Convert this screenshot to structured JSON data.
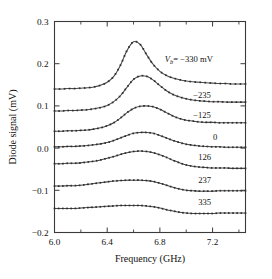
{
  "figure": {
    "background": "#ffffff",
    "curve_color": "#4a4a4a",
    "marker_color": "#2e2e2e",
    "axis_color": "#3a3a3a"
  },
  "chart_data": {
    "type": "line",
    "title": "",
    "xlabel": "Frequency (GHz)",
    "ylabel": "Diode signal (mV)",
    "xlim": [
      6.0,
      7.45
    ],
    "ylim": [
      -0.2,
      0.3
    ],
    "xticks": [
      6.0,
      6.4,
      6.8,
      7.2
    ],
    "xticklabels": [
      "6.0",
      "6.4",
      "6.8",
      "7.2"
    ],
    "xminorticks": [
      6.2,
      6.6,
      7.0,
      7.4
    ],
    "yticks": [
      0.3,
      0.2,
      0.1,
      0.0,
      -0.1,
      -0.2
    ],
    "yticklabels": [
      "0.3",
      "0.2",
      "0.1",
      "0.0",
      "-0.1",
      "-0.2"
    ],
    "grid": false,
    "legend": "inline-right-labels",
    "marker": "small-square",
    "annotation_prefix": "Vb =",
    "annotation_unit": "mV",
    "series": [
      {
        "name": "-330 mV",
        "label": "-330 mV",
        "label_full": "Vb = -330 mV",
        "label_x": 7.02,
        "label_y": 0.205,
        "baseline": 0.14,
        "amplitude": 0.112,
        "center": 6.605,
        "width": 0.165,
        "tail": 0.013,
        "x": [
          6.0,
          6.05,
          6.1,
          6.15,
          6.2,
          6.25,
          6.3,
          6.35,
          6.4,
          6.45,
          6.5,
          6.55,
          6.6,
          6.65,
          6.7,
          6.75,
          6.8,
          6.85,
          6.9,
          6.95,
          7.0,
          7.05,
          7.1,
          7.15,
          7.2,
          7.25,
          7.3,
          7.35,
          7.4,
          7.45
        ],
        "y": [
          0.14,
          0.14,
          0.141,
          0.141,
          0.142,
          0.143,
          0.145,
          0.149,
          0.156,
          0.17,
          0.196,
          0.231,
          0.252,
          0.246,
          0.221,
          0.198,
          0.182,
          0.172,
          0.166,
          0.162,
          0.159,
          0.157,
          0.156,
          0.155,
          0.154,
          0.153,
          0.153,
          0.152,
          0.152,
          0.152
        ]
      },
      {
        "name": "-235",
        "label": "-235",
        "label_x": 7.12,
        "label_y": 0.118,
        "baseline": 0.088,
        "amplitude": 0.082,
        "center": 6.755,
        "width": 0.185,
        "tail": 0.011,
        "x": [
          6.0,
          6.05,
          6.1,
          6.15,
          6.2,
          6.25,
          6.3,
          6.35,
          6.4,
          6.45,
          6.5,
          6.55,
          6.6,
          6.65,
          6.7,
          6.75,
          6.8,
          6.85,
          6.9,
          6.95,
          7.0,
          7.05,
          7.1,
          7.15,
          7.2,
          7.25,
          7.3,
          7.35,
          7.4,
          7.45
        ],
        "y": [
          0.088,
          0.088,
          0.089,
          0.089,
          0.09,
          0.091,
          0.093,
          0.096,
          0.101,
          0.11,
          0.124,
          0.144,
          0.163,
          0.171,
          0.17,
          0.161,
          0.148,
          0.136,
          0.127,
          0.121,
          0.117,
          0.114,
          0.112,
          0.111,
          0.11,
          0.11,
          0.109,
          0.109,
          0.109,
          0.109
        ]
      },
      {
        "name": "-125",
        "label": "-125",
        "label_x": 7.12,
        "label_y": 0.072,
        "baseline": 0.04,
        "amplitude": 0.055,
        "center": 6.8,
        "width": 0.195,
        "tail": 0.01,
        "x": [
          6.0,
          6.05,
          6.1,
          6.15,
          6.2,
          6.25,
          6.3,
          6.35,
          6.4,
          6.45,
          6.5,
          6.55,
          6.6,
          6.65,
          6.7,
          6.75,
          6.8,
          6.85,
          6.9,
          6.95,
          7.0,
          7.05,
          7.1,
          7.15,
          7.2,
          7.25,
          7.3,
          7.35,
          7.4,
          7.45
        ],
        "y": [
          0.04,
          0.04,
          0.041,
          0.041,
          0.042,
          0.043,
          0.045,
          0.048,
          0.053,
          0.06,
          0.071,
          0.084,
          0.094,
          0.099,
          0.1,
          0.098,
          0.092,
          0.084,
          0.076,
          0.07,
          0.066,
          0.064,
          0.062,
          0.061,
          0.061,
          0.06,
          0.06,
          0.06,
          0.06,
          0.06
        ]
      },
      {
        "name": "0",
        "label": "0",
        "label_x": 7.22,
        "label_y": 0.02,
        "baseline": 0.003,
        "amplitude": 0.034,
        "center": 6.745,
        "width": 0.215,
        "tail": 0.006,
        "x": [
          6.0,
          6.05,
          6.1,
          6.15,
          6.2,
          6.25,
          6.3,
          6.35,
          6.4,
          6.45,
          6.5,
          6.55,
          6.6,
          6.65,
          6.7,
          6.75,
          6.8,
          6.85,
          6.9,
          6.95,
          7.0,
          7.05,
          7.1,
          7.15,
          7.2,
          7.25,
          7.3,
          7.35,
          7.4,
          7.45
        ],
        "y": [
          0.003,
          0.003,
          0.004,
          0.004,
          0.005,
          0.006,
          0.008,
          0.01,
          0.013,
          0.018,
          0.024,
          0.03,
          0.035,
          0.037,
          0.037,
          0.035,
          0.03,
          0.024,
          0.018,
          0.013,
          0.009,
          0.007,
          0.005,
          0.004,
          0.003,
          0.003,
          0.002,
          0.002,
          0.002,
          0.002
        ]
      },
      {
        "name": "126",
        "label": "126",
        "label_x": 7.14,
        "label_y": -0.028,
        "baseline": -0.037,
        "amplitude": 0.03,
        "center": 6.71,
        "width": 0.235,
        "tail": 0.004,
        "x": [
          6.0,
          6.05,
          6.1,
          6.15,
          6.2,
          6.25,
          6.3,
          6.35,
          6.4,
          6.45,
          6.5,
          6.55,
          6.6,
          6.65,
          6.7,
          6.75,
          6.8,
          6.85,
          6.9,
          6.95,
          7.0,
          7.05,
          7.1,
          7.15,
          7.2,
          7.25,
          7.3,
          7.35,
          7.4,
          7.45
        ],
        "y": [
          -0.037,
          -0.037,
          -0.036,
          -0.036,
          -0.035,
          -0.033,
          -0.031,
          -0.028,
          -0.024,
          -0.02,
          -0.015,
          -0.011,
          -0.008,
          -0.007,
          -0.008,
          -0.011,
          -0.016,
          -0.022,
          -0.029,
          -0.035,
          -0.04,
          -0.043,
          -0.045,
          -0.046,
          -0.047,
          -0.047,
          -0.047,
          -0.048,
          -0.048,
          -0.048
        ]
      },
      {
        "name": "237",
        "label": "237",
        "label_x": 7.14,
        "label_y": -0.082,
        "baseline": -0.09,
        "amplitude": 0.017,
        "center": 6.66,
        "width": 0.29,
        "tail": 0.002,
        "x": [
          6.0,
          6.05,
          6.1,
          6.15,
          6.2,
          6.25,
          6.3,
          6.35,
          6.4,
          6.45,
          6.5,
          6.55,
          6.6,
          6.65,
          6.7,
          6.75,
          6.8,
          6.85,
          6.9,
          6.95,
          7.0,
          7.05,
          7.1,
          7.15,
          7.2,
          7.25,
          7.3,
          7.35,
          7.4,
          7.45
        ],
        "y": [
          -0.09,
          -0.09,
          -0.089,
          -0.089,
          -0.088,
          -0.086,
          -0.084,
          -0.082,
          -0.08,
          -0.078,
          -0.077,
          -0.076,
          -0.076,
          -0.076,
          -0.077,
          -0.079,
          -0.083,
          -0.088,
          -0.093,
          -0.097,
          -0.1,
          -0.101,
          -0.102,
          -0.102,
          -0.102,
          -0.101,
          -0.101,
          -0.101,
          -0.101,
          -0.101
        ]
      },
      {
        "name": "335",
        "label": "335",
        "label_x": 7.14,
        "label_y": -0.134,
        "baseline": -0.143,
        "amplitude": 0.012,
        "center": 6.66,
        "width": 0.3,
        "tail": 0.001,
        "x": [
          6.0,
          6.05,
          6.1,
          6.15,
          6.2,
          6.25,
          6.3,
          6.35,
          6.4,
          6.45,
          6.5,
          6.55,
          6.6,
          6.65,
          6.7,
          6.75,
          6.8,
          6.85,
          6.9,
          6.95,
          7.0,
          7.05,
          7.1,
          7.15,
          7.2,
          7.25,
          7.3,
          7.35,
          7.4,
          7.45
        ],
        "y": [
          -0.143,
          -0.143,
          -0.143,
          -0.143,
          -0.142,
          -0.141,
          -0.14,
          -0.139,
          -0.138,
          -0.137,
          -0.136,
          -0.136,
          -0.136,
          -0.136,
          -0.137,
          -0.139,
          -0.142,
          -0.146,
          -0.149,
          -0.152,
          -0.154,
          -0.155,
          -0.155,
          -0.155,
          -0.155,
          -0.154,
          -0.154,
          -0.154,
          -0.154,
          -0.154
        ]
      }
    ]
  }
}
